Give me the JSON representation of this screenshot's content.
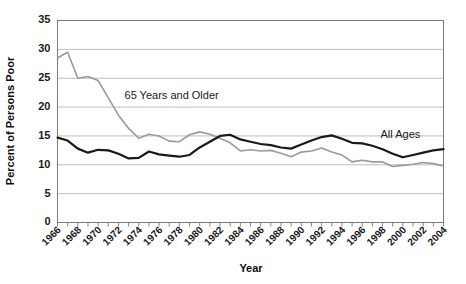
{
  "chart_data": {
    "type": "line",
    "title": "",
    "xlabel": "Year",
    "ylabel": "Percent of Persons Poor",
    "xlim": [
      1966,
      2004
    ],
    "ylim": [
      0,
      35
    ],
    "yticks": [
      0,
      5,
      10,
      15,
      20,
      25,
      30,
      35
    ],
    "grid": "horizontal",
    "legend": "inline-annotations",
    "x": [
      1966,
      1967,
      1968,
      1969,
      1970,
      1971,
      1972,
      1973,
      1974,
      1975,
      1976,
      1977,
      1978,
      1979,
      1980,
      1981,
      1982,
      1983,
      1984,
      1985,
      1986,
      1987,
      1988,
      1989,
      1990,
      1991,
      1992,
      1993,
      1994,
      1995,
      1996,
      1997,
      1998,
      1999,
      2000,
      2001,
      2002,
      2003,
      2004
    ],
    "xtick_labels": [
      "1966",
      "1968",
      "1970",
      "1972",
      "1974",
      "1976",
      "1978",
      "1980",
      "1982",
      "1984",
      "1986",
      "1988",
      "1990",
      "1992",
      "1994",
      "1996",
      "1998",
      "2000",
      "2002",
      "2004"
    ],
    "series": [
      {
        "name": "65 Years and Older",
        "color": "#9a9a9a",
        "label_x": 1972.6,
        "label_y": 21.4,
        "values": [
          28.5,
          29.5,
          25.0,
          25.3,
          24.6,
          21.6,
          18.6,
          16.3,
          14.6,
          15.3,
          15.0,
          14.1,
          14.0,
          15.2,
          15.7,
          15.3,
          14.6,
          13.8,
          12.4,
          12.6,
          12.4,
          12.5,
          12.0,
          11.4,
          12.2,
          12.4,
          12.9,
          12.2,
          11.7,
          10.5,
          10.8,
          10.5,
          10.5,
          9.7,
          9.9,
          10.1,
          10.4,
          10.2,
          9.8
        ]
      },
      {
        "name": "All Ages",
        "color": "#1a1a1a",
        "label_x": 1997.8,
        "label_y": 14.6,
        "values": [
          14.7,
          14.2,
          12.8,
          12.1,
          12.6,
          12.5,
          11.9,
          11.1,
          11.2,
          12.3,
          11.8,
          11.6,
          11.4,
          11.7,
          13.0,
          14.0,
          15.0,
          15.2,
          14.4,
          14.0,
          13.6,
          13.4,
          13.0,
          12.8,
          13.5,
          14.2,
          14.8,
          15.1,
          14.5,
          13.8,
          13.7,
          13.3,
          12.7,
          11.9,
          11.3,
          11.7,
          12.1,
          12.5,
          12.7
        ]
      }
    ]
  }
}
